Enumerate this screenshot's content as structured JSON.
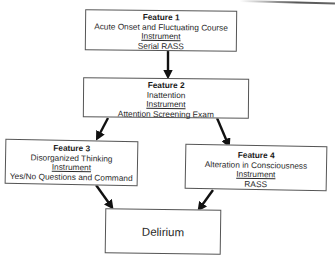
{
  "diagram": {
    "type": "flowchart",
    "nodes": [
      {
        "id": "feature1",
        "title": "Feature 1",
        "description": "Acute Onset and Fluctuating Course",
        "instrument_label": "Instrument",
        "instrument": "Serial RASS"
      },
      {
        "id": "feature2",
        "title": "Feature 2",
        "description": "Inattention",
        "instrument_label": "Instrument",
        "instrument": "Attention Screening Exam"
      },
      {
        "id": "feature3",
        "title": "Feature 3",
        "description": "Disorganized Thinking",
        "instrument_label": "Instrument",
        "instrument": "Yes/No Questions and Command"
      },
      {
        "id": "feature4",
        "title": "Feature 4",
        "description": "Alteration in Consciousness",
        "instrument_label": "Instrument",
        "instrument": "RASS"
      },
      {
        "id": "delirium",
        "label": "Delirium"
      }
    ],
    "edges": [
      {
        "from": "feature1",
        "to": "feature2"
      },
      {
        "from": "feature2",
        "to": "feature3"
      },
      {
        "from": "feature2",
        "to": "feature4"
      },
      {
        "from": "feature3",
        "to": "delirium"
      },
      {
        "from": "feature4",
        "to": "delirium"
      }
    ],
    "colors": {
      "border": "#555555",
      "arrow": "#111111",
      "text": "#2a2a2a",
      "background": "#ffffff"
    }
  }
}
